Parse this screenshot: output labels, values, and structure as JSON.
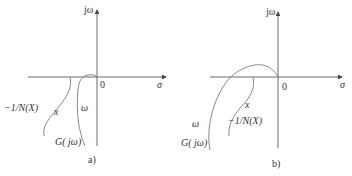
{
  "panels": [
    {
      "id": "a",
      "caption": "a)",
      "axis_labels": {
        "imag": "jω",
        "real": "σ",
        "origin": "0"
      },
      "curves": [
        {
          "name": "-1/N(X)",
          "label": "−1/N(X)",
          "param_label": "x"
        },
        {
          "name": "G(jω)",
          "label": "G( jω)",
          "param_label": "ω"
        }
      ]
    },
    {
      "id": "b",
      "caption": "b)",
      "axis_labels": {
        "imag": "jω",
        "real": "σ",
        "origin": "0"
      },
      "curves": [
        {
          "name": "-1/N(X)",
          "label": "−1/N(X)",
          "param_label": "x"
        },
        {
          "name": "G(jω)",
          "label": "G( jω)",
          "param_label": "ω"
        }
      ]
    }
  ],
  "colors": {
    "axis": "#444444",
    "curve": "#888888",
    "text": "#333333"
  }
}
